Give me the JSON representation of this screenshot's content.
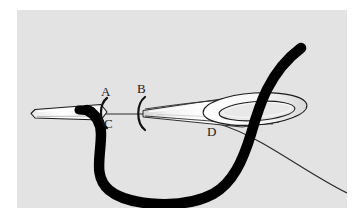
{
  "figure": {
    "panel": {
      "background_color": "#e3e3e3",
      "page_background_color": "#ffffff",
      "width": 330,
      "height": 198
    },
    "labels": [
      {
        "id": "A",
        "text": "A",
        "description": "needle point / tip region marker, arc bracket to its left"
      },
      {
        "id": "B",
        "text": "B",
        "description": "needle shaft marker, arc bracket below it"
      },
      {
        "id": "C",
        "text": "C",
        "description": "thread emerging below needle point"
      },
      {
        "id": "D",
        "text": "D",
        "description": "needle eye / thread crossing region"
      }
    ],
    "elements": {
      "needle_color": "#f4f4f4",
      "needle_outline_color": "#1b1b1b",
      "thread_thick_color": "#000000",
      "thread_thin_color": "#1b1b1b",
      "needle_eye_label": "needle-eye",
      "needle_tip_label": "needle-tip"
    }
  }
}
